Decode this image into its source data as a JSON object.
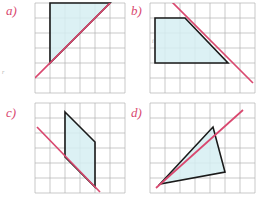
{
  "figure": {
    "title": "",
    "background": "#ffffff",
    "width": 261,
    "height": 201,
    "grid_color": "#9a9a9a",
    "grid_spacing": 15,
    "shape_stroke": "#1a1a1a",
    "shape_fill": "#d6eef2",
    "line_color": "#d9486f",
    "label_color": "#d9486f"
  },
  "panels": [
    {
      "id": "a",
      "label": "a)",
      "label_x": 6,
      "label_y": 6,
      "origin_x": 35,
      "origin_y": 3,
      "cols": 6,
      "rows": 6,
      "shape_type": "right-triangle",
      "shape_points": "50,3 110,3 50,63",
      "line_points": "35,78 118,-5",
      "shape_vertices": [
        [
          50,
          3
        ],
        [
          110,
          3
        ],
        [
          50,
          63
        ]
      ],
      "line_endpoints": [
        [
          35,
          78
        ],
        [
          118,
          -5
        ]
      ],
      "edge_note": "vertical-left-and-top-edges-black, hypotenuse-pink"
    },
    {
      "id": "b",
      "label": "b)",
      "label_x": 131,
      "label_y": 6,
      "origin_x": 150,
      "origin_y": 3,
      "cols": 7,
      "rows": 6,
      "shape_type": "trapezoid",
      "shape_points": "155,18 185,18 228,63 155,63",
      "line_points": "167,-3 253,83",
      "shape_vertices": [
        [
          155,
          18
        ],
        [
          185,
          18
        ],
        [
          228,
          63
        ],
        [
          155,
          63
        ]
      ],
      "line_endpoints": [
        [
          167,
          -3
        ],
        [
          253,
          83
        ]
      ],
      "edge_note": "left-top-bottom-edges-black, slanted-edge-pink"
    },
    {
      "id": "c",
      "label": "c)",
      "label_x": 6,
      "label_y": 108,
      "origin_x": 35,
      "origin_y": 103,
      "cols": 6,
      "rows": 6,
      "shape_type": "parallelogram",
      "shape_points": "65,112 95,142 95,187 65,157",
      "line_points": "37,127 100,192",
      "shape_vertices": [
        [
          65,
          112
        ],
        [
          95,
          142
        ],
        [
          95,
          187
        ],
        [
          65,
          157
        ]
      ],
      "line_endpoints": [
        [
          37,
          127
        ],
        [
          100,
          192
        ]
      ],
      "edge_note": "two-vertical-sides-and-top-slant-black, bottom-slant-pink"
    },
    {
      "id": "d",
      "label": "d)",
      "label_x": 131,
      "label_y": 108,
      "origin_x": 150,
      "origin_y": 103,
      "cols": 7,
      "rows": 6,
      "shape_type": "triangle",
      "shape_points": "160,184 213,127 225,172",
      "line_points": "156,188 243,110",
      "shape_vertices": [
        [
          160,
          184
        ],
        [
          213,
          127
        ],
        [
          225,
          172
        ]
      ],
      "line_endpoints": [
        [
          156,
          188
        ],
        [
          243,
          110
        ]
      ],
      "edge_note": "bottom-and-right-edges-black, long-edge-pink"
    }
  ],
  "tick_marks": [
    {
      "text": "r",
      "x": 2,
      "y": 72
    },
    {
      "text": "i",
      "x": 154,
      "y": 40
    }
  ]
}
